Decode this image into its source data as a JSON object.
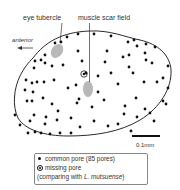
{
  "figure": {
    "labels": {
      "eye_tubercle": "eye tubercle",
      "muscle_scar_field": "muscle scar field",
      "anterior": "anterior",
      "scale_bar": "0.1mm"
    },
    "legend": {
      "common_pore": "common pore (85 pores)",
      "missing_pore": "missing pore",
      "comparing_prefix": "(comparing with ",
      "comparing_species": "L. mutsuense",
      "comparing_suffix": ")"
    },
    "colors": {
      "outline": "#2a2a2a",
      "pore": "#111111",
      "feature_fill": "#b8b8b8",
      "text": "#333333"
    },
    "common_pore_count": 85
  }
}
